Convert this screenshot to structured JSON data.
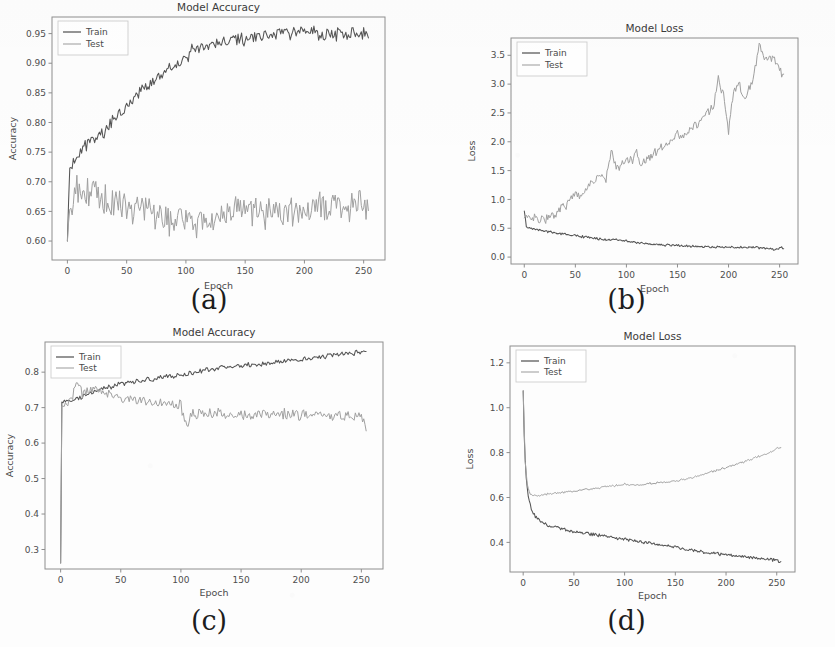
{
  "figure": {
    "background_color": "#fdfdfd",
    "panels_order": [
      "a",
      "b",
      "c",
      "d"
    ],
    "legend_labels": [
      "Train",
      "Test"
    ],
    "series_colors": {
      "train": "#555555",
      "test": "#a0a0a0"
    },
    "axis_color": "#8e8e8e"
  },
  "captions": {
    "a": "(a)",
    "b": "(b)",
    "c": "(c)",
    "d": "(d)"
  },
  "chart_data": [
    {
      "id": "a",
      "type": "line",
      "title": "Model Accuracy",
      "xlabel": "Epoch",
      "ylabel": "Accuracy",
      "xlim": [
        -13,
        268
      ],
      "ylim": [
        0.568,
        0.978
      ],
      "xticks": [
        0,
        50,
        100,
        150,
        200,
        250
      ],
      "yticks": [
        0.6,
        0.65,
        0.7,
        0.75,
        0.8,
        0.85,
        0.9,
        0.95
      ],
      "ytick_labels": [
        "0.60",
        "0.65",
        "0.70",
        "0.75",
        "0.80",
        "0.85",
        "0.90",
        "0.95"
      ],
      "xtick_labels": [
        "0",
        "50",
        "100",
        "150",
        "200",
        "250"
      ],
      "grid": false,
      "legend_position": "upper left",
      "series": [
        {
          "name": "Train",
          "role": "train",
          "noise": 0.009,
          "x": [
            0,
            2,
            5,
            8,
            12,
            16,
            20,
            25,
            30,
            35,
            40,
            45,
            50,
            55,
            60,
            65,
            70,
            75,
            80,
            85,
            90,
            95,
            100,
            105,
            110,
            120,
            130,
            140,
            150,
            160,
            170,
            180,
            190,
            200,
            210,
            220,
            230,
            240,
            250,
            254
          ],
          "values": [
            0.6,
            0.723,
            0.735,
            0.744,
            0.752,
            0.762,
            0.768,
            0.776,
            0.784,
            0.795,
            0.806,
            0.818,
            0.828,
            0.838,
            0.848,
            0.857,
            0.866,
            0.874,
            0.881,
            0.888,
            0.895,
            0.901,
            0.91,
            0.92,
            0.926,
            0.93,
            0.932,
            0.936,
            0.941,
            0.945,
            0.949,
            0.951,
            0.95,
            0.952,
            0.951,
            0.948,
            0.95,
            0.951,
            0.949,
            0.95
          ]
        },
        {
          "name": "Test",
          "role": "test",
          "noise": 0.024,
          "x": [
            0,
            2,
            5,
            8,
            12,
            16,
            20,
            25,
            30,
            35,
            40,
            45,
            50,
            55,
            60,
            65,
            70,
            75,
            80,
            85,
            90,
            95,
            100,
            105,
            110,
            120,
            130,
            140,
            150,
            160,
            170,
            180,
            190,
            200,
            210,
            220,
            230,
            240,
            250,
            254
          ],
          "values": [
            0.6,
            0.668,
            0.676,
            0.682,
            0.686,
            0.69,
            0.684,
            0.678,
            0.672,
            0.666,
            0.662,
            0.658,
            0.655,
            0.652,
            0.65,
            0.648,
            0.65,
            0.646,
            0.641,
            0.638,
            0.636,
            0.634,
            0.637,
            0.64,
            0.638,
            0.644,
            0.642,
            0.646,
            0.648,
            0.645,
            0.65,
            0.652,
            0.648,
            0.646,
            0.652,
            0.658,
            0.66,
            0.656,
            0.66,
            0.662
          ]
        }
      ]
    },
    {
      "id": "b",
      "type": "line",
      "title": "Model Loss",
      "xlabel": "Epoch",
      "ylabel": "Loss",
      "xlim": [
        -13,
        268
      ],
      "ylim": [
        -0.12,
        3.8
      ],
      "xticks": [
        0,
        50,
        100,
        150,
        200,
        250
      ],
      "yticks": [
        0.0,
        0.5,
        1.0,
        1.5,
        2.0,
        2.5,
        3.0,
        3.5
      ],
      "ytick_labels": [
        "0.0",
        "0.5",
        "1.0",
        "1.5",
        "2.0",
        "2.5",
        "3.0",
        "3.5"
      ],
      "xtick_labels": [
        "0",
        "50",
        "100",
        "150",
        "200",
        "250"
      ],
      "grid": false,
      "legend_position": "upper left",
      "series": [
        {
          "name": "Train",
          "role": "train",
          "noise": 0.016,
          "x": [
            0,
            2,
            5,
            8,
            12,
            16,
            20,
            25,
            30,
            35,
            40,
            45,
            50,
            55,
            60,
            65,
            70,
            75,
            80,
            85,
            90,
            95,
            100,
            110,
            120,
            130,
            140,
            150,
            160,
            170,
            180,
            190,
            200,
            210,
            220,
            230,
            240,
            248,
            252,
            254
          ],
          "values": [
            0.8,
            0.53,
            0.51,
            0.495,
            0.48,
            0.466,
            0.452,
            0.436,
            0.422,
            0.408,
            0.396,
            0.384,
            0.372,
            0.36,
            0.348,
            0.336,
            0.324,
            0.312,
            0.3,
            0.295,
            0.3,
            0.288,
            0.282,
            0.252,
            0.232,
            0.216,
            0.206,
            0.2,
            0.192,
            0.186,
            0.18,
            0.176,
            0.172,
            0.17,
            0.168,
            0.162,
            0.15,
            0.13,
            0.165,
            0.15
          ]
        },
        {
          "name": "Test",
          "role": "test",
          "noise": 0.065,
          "x": [
            0,
            2,
            5,
            10,
            15,
            20,
            25,
            30,
            35,
            40,
            45,
            50,
            55,
            60,
            65,
            70,
            75,
            80,
            85,
            90,
            95,
            100,
            105,
            110,
            115,
            120,
            125,
            130,
            135,
            140,
            145,
            150,
            155,
            160,
            165,
            170,
            175,
            180,
            185,
            190,
            195,
            200,
            205,
            210,
            215,
            220,
            225,
            230,
            235,
            240,
            245,
            250,
            254
          ],
          "values": [
            0.68,
            0.66,
            0.665,
            0.668,
            0.672,
            0.66,
            0.7,
            0.76,
            0.83,
            0.9,
            0.96,
            1.12,
            1.08,
            1.18,
            1.28,
            1.34,
            1.42,
            1.33,
            1.82,
            1.56,
            1.6,
            1.68,
            1.66,
            1.82,
            1.56,
            1.7,
            1.76,
            1.84,
            1.9,
            1.96,
            2.04,
            2.16,
            2.1,
            2.18,
            2.25,
            2.32,
            2.42,
            2.52,
            2.6,
            3.08,
            2.82,
            2.2,
            2.9,
            3.02,
            2.76,
            2.9,
            3.14,
            3.68,
            3.42,
            3.48,
            3.42,
            3.24,
            3.16
          ]
        }
      ]
    },
    {
      "id": "c",
      "type": "line",
      "title": "Model Accuracy",
      "xlabel": "Epoch",
      "ylabel": "Accuracy",
      "xlim": [
        -13,
        268
      ],
      "ylim": [
        0.245,
        0.885
      ],
      "xticks": [
        0,
        50,
        100,
        150,
        200,
        250
      ],
      "yticks": [
        0.3,
        0.4,
        0.5,
        0.6,
        0.7,
        0.8
      ],
      "ytick_labels": [
        "0.3",
        "0.4",
        "0.5",
        "0.6",
        "0.7",
        "0.8"
      ],
      "xtick_labels": [
        "0",
        "50",
        "100",
        "150",
        "200",
        "250"
      ],
      "grid": false,
      "legend_position": "upper left",
      "series": [
        {
          "name": "Train",
          "role": "train",
          "noise": 0.006,
          "x": [
            0,
            1,
            3,
            6,
            10,
            15,
            20,
            25,
            30,
            40,
            50,
            60,
            70,
            80,
            90,
            100,
            110,
            120,
            130,
            140,
            150,
            160,
            170,
            180,
            190,
            200,
            210,
            220,
            230,
            240,
            250,
            254
          ],
          "values": [
            0.262,
            0.712,
            0.714,
            0.716,
            0.72,
            0.726,
            0.732,
            0.74,
            0.748,
            0.758,
            0.766,
            0.772,
            0.778,
            0.782,
            0.788,
            0.792,
            0.798,
            0.804,
            0.812,
            0.814,
            0.818,
            0.82,
            0.824,
            0.828,
            0.832,
            0.836,
            0.84,
            0.846,
            0.85,
            0.852,
            0.856,
            0.857
          ]
        },
        {
          "name": "Test",
          "role": "test",
          "noise": 0.013,
          "x": [
            0,
            1,
            3,
            6,
            10,
            14,
            18,
            22,
            26,
            30,
            35,
            40,
            45,
            50,
            55,
            60,
            65,
            70,
            75,
            80,
            85,
            90,
            95,
            100,
            105,
            110,
            120,
            130,
            140,
            150,
            160,
            170,
            180,
            190,
            200,
            210,
            220,
            230,
            240,
            250,
            254
          ],
          "values": [
            0.262,
            0.71,
            0.712,
            0.718,
            0.738,
            0.772,
            0.742,
            0.748,
            0.744,
            0.748,
            0.742,
            0.74,
            0.734,
            0.728,
            0.724,
            0.722,
            0.722,
            0.72,
            0.714,
            0.712,
            0.714,
            0.71,
            0.708,
            0.706,
            0.652,
            0.678,
            0.682,
            0.686,
            0.678,
            0.684,
            0.68,
            0.684,
            0.68,
            0.684,
            0.678,
            0.682,
            0.678,
            0.68,
            0.676,
            0.672,
            0.64
          ]
        }
      ]
    },
    {
      "id": "d",
      "type": "line",
      "title": "Model Loss",
      "xlabel": "Epoch",
      "ylabel": "Loss",
      "xlim": [
        -13,
        268
      ],
      "ylim": [
        0.268,
        1.275
      ],
      "xticks": [
        0,
        50,
        100,
        150,
        200,
        250
      ],
      "yticks": [
        0.4,
        0.6,
        0.8,
        1.0,
        1.2
      ],
      "ytick_labels": [
        "0.4",
        "0.6",
        "0.8",
        "1.0",
        "1.2"
      ],
      "xtick_labels": [
        "0",
        "50",
        "100",
        "150",
        "200",
        "250"
      ],
      "grid": false,
      "legend_position": "upper left",
      "series": [
        {
          "name": "Train",
          "role": "train",
          "noise": 0.006,
          "x": [
            0,
            1,
            2,
            3,
            5,
            8,
            12,
            16,
            20,
            25,
            30,
            35,
            40,
            45,
            50,
            60,
            70,
            80,
            90,
            100,
            110,
            120,
            130,
            140,
            150,
            160,
            170,
            180,
            190,
            200,
            210,
            220,
            230,
            240,
            250,
            254
          ],
          "values": [
            1.075,
            0.88,
            0.76,
            0.68,
            0.6,
            0.548,
            0.516,
            0.498,
            0.488,
            0.476,
            0.47,
            0.464,
            0.458,
            0.452,
            0.448,
            0.442,
            0.436,
            0.428,
            0.42,
            0.414,
            0.406,
            0.4,
            0.394,
            0.386,
            0.38,
            0.368,
            0.362,
            0.356,
            0.35,
            0.344,
            0.34,
            0.336,
            0.33,
            0.326,
            0.32,
            0.308
          ]
        },
        {
          "name": "Test",
          "role": "test",
          "noise": 0.004,
          "x": [
            0,
            2,
            4,
            6,
            8,
            10,
            14,
            18,
            22,
            26,
            30,
            40,
            50,
            60,
            70,
            80,
            90,
            100,
            110,
            120,
            130,
            140,
            150,
            160,
            170,
            180,
            190,
            200,
            210,
            220,
            230,
            240,
            250,
            254
          ],
          "values": [
            1.075,
            0.76,
            0.66,
            0.625,
            0.612,
            0.608,
            0.61,
            0.612,
            0.614,
            0.616,
            0.618,
            0.622,
            0.628,
            0.634,
            0.64,
            0.646,
            0.652,
            0.66,
            0.656,
            0.66,
            0.664,
            0.668,
            0.672,
            0.682,
            0.692,
            0.706,
            0.72,
            0.734,
            0.748,
            0.762,
            0.78,
            0.794,
            0.818,
            0.82
          ]
        }
      ]
    }
  ]
}
